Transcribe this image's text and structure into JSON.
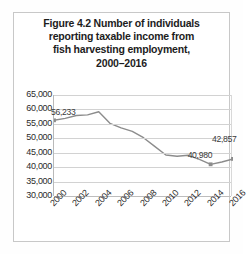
{
  "figure": {
    "title_lines": [
      "Figure 4.2 Number of individuals",
      "reporting taxable income from",
      "fish harvesting employment,",
      "2000–2016"
    ]
  },
  "chart_data": {
    "type": "line",
    "title": "Figure 4.2 Number of individuals reporting taxable income from fish harvesting employment, 2000–2016",
    "xlabel": "",
    "ylabel": "",
    "x": [
      2000,
      2001,
      2002,
      2003,
      2004,
      2005,
      2006,
      2007,
      2008,
      2009,
      2010,
      2011,
      2012,
      2013,
      2014,
      2015,
      2016
    ],
    "values": [
      56233,
      56900,
      57900,
      58100,
      59200,
      55200,
      53600,
      52400,
      50200,
      47200,
      44200,
      43800,
      44100,
      42700,
      40980,
      41800,
      42857
    ],
    "tick_x": [
      2000,
      2002,
      2004,
      2006,
      2008,
      2010,
      2012,
      2014,
      2016
    ],
    "xtick_labels": [
      "2000",
      "2002",
      "2004",
      "2006",
      "2008",
      "2010",
      "2012",
      "2014",
      "2016"
    ],
    "ytick_labels": [
      "65,000",
      "60,000",
      "55,000",
      "50,000",
      "45,000",
      "40,000",
      "35,000",
      "30,000"
    ],
    "ytick_values": [
      65000,
      60000,
      55000,
      50000,
      45000,
      40000,
      35000,
      30000
    ],
    "ylim": [
      30000,
      65000
    ],
    "xlim": [
      2000,
      2016
    ],
    "grid": true,
    "legend": false,
    "line_color": "#8c8c8c",
    "marker_color": "#8c8c8c",
    "data_labels": [
      {
        "label": "56,233",
        "x": 2000,
        "y": 56233
      },
      {
        "label": "40,980",
        "x": 2014,
        "y": 40980
      },
      {
        "label": "42,857",
        "x": 2016,
        "y": 42857
      }
    ],
    "markers_at": [
      2000,
      2014,
      2016
    ]
  }
}
